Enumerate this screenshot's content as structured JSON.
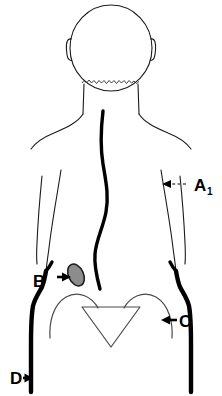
{
  "figure": {
    "view": "posterior",
    "background_color": "#ffffff",
    "line_color": "#000000",
    "marker_color": "#8c8c8c",
    "labels": [
      {
        "id": "A1",
        "text": "A",
        "subscript": "1",
        "pointer": "dashed-leader-with-arrowhead",
        "arrow_direction": "left",
        "target": "right lateral trunk / flank"
      },
      {
        "id": "B",
        "text": "B",
        "subscript": "",
        "pointer": "solid-arrow",
        "arrow_direction": "right",
        "target": "left kidney region marker"
      },
      {
        "id": "C",
        "text": "C",
        "subscript": "",
        "pointer": "solid-arrow",
        "arrow_direction": "left",
        "target": "right iliac crest / hip"
      },
      {
        "id": "D",
        "text": "D",
        "subscript": "",
        "pointer": "solid-arrow",
        "arrow_direction": "right",
        "target": "left lateral thigh"
      }
    ],
    "marker": {
      "name": "shaded-oval-marker",
      "shape": "ellipse",
      "fill": "#8c8c8c",
      "outline": "#1a1a1a",
      "rotation_deg": -25
    },
    "parts": [
      "head",
      "left-ear",
      "right-ear",
      "hairline",
      "neck",
      "left-shoulder",
      "right-shoulder",
      "left-arm",
      "right-arm",
      "spine",
      "left-trunk",
      "right-trunk",
      "left-hip",
      "right-hip",
      "pelvis-left-iliac-crest",
      "pelvis-right-iliac-crest",
      "sacrum-triangle",
      "left-thigh",
      "right-thigh"
    ]
  }
}
